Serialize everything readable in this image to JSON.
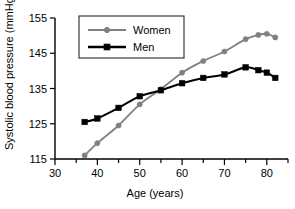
{
  "chart_data": {
    "type": "line",
    "title": "",
    "xlabel": "Age (years)",
    "ylabel": "Systolic blood pressure (mmHg)",
    "xlim": [
      30,
      85
    ],
    "ylim": [
      115,
      155
    ],
    "xticks": [
      30,
      40,
      50,
      60,
      70,
      80
    ],
    "xtick_labels": [
      "30",
      "40",
      "50",
      "60",
      "70",
      "80"
    ],
    "xminor_ticks": [
      35,
      45,
      55,
      65,
      75,
      85
    ],
    "yticks": [
      115,
      125,
      135,
      145,
      155
    ],
    "ytick_labels": [
      "115",
      "125",
      "135",
      "145",
      "155"
    ],
    "grid": false,
    "legend_position": "upper-left",
    "series": [
      {
        "name": "Women",
        "color": "#808080",
        "marker": "circle",
        "x": [
          37,
          40,
          45,
          50,
          55,
          60,
          65,
          70,
          75,
          78,
          80,
          82
        ],
        "values": [
          116.0,
          119.5,
          124.5,
          130.5,
          134.8,
          139.5,
          142.8,
          145.5,
          149.0,
          150.2,
          150.5,
          149.5
        ]
      },
      {
        "name": "Men",
        "color": "#000000",
        "marker": "square",
        "x": [
          37,
          40,
          45,
          50,
          55,
          60,
          65,
          70,
          75,
          78,
          80,
          82
        ],
        "values": [
          125.5,
          126.5,
          129.5,
          132.8,
          134.5,
          136.5,
          138.0,
          139.0,
          141.0,
          140.2,
          139.5,
          138.0
        ]
      }
    ],
    "legend_entries": [
      {
        "label": "Women",
        "color": "#808080",
        "marker": "circle"
      },
      {
        "label": "Men",
        "color": "#000000",
        "marker": "square"
      }
    ]
  }
}
